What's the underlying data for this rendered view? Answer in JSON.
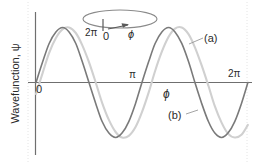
{
  "figure": {
    "axis_color": "#6f6f6f",
    "curve_a_color": "#d0d0d0",
    "curve_b_color": "#7a7a7a",
    "guide_color": "#e2e2e2"
  },
  "axes": {
    "y_title": "Wavefunction, ψ",
    "x_title": "ϕ",
    "x_ticks": [
      {
        "name": "origin",
        "label": "0"
      },
      {
        "name": "pi",
        "label": "π"
      },
      {
        "name": "two-pi",
        "label": "2π"
      }
    ]
  },
  "ring": {
    "label_start": "2π",
    "label_zero": "0",
    "label_angle": "ϕ"
  },
  "curves": [
    {
      "key": "a",
      "label": "(a)"
    },
    {
      "key": "b",
      "label": "(b)"
    }
  ],
  "chart_data": {
    "type": "line",
    "xlabel": "ϕ",
    "ylabel": "Wavefunction, ψ",
    "xlim": [
      0,
      6.283185307179586
    ],
    "ylim": [
      -1.15,
      1.15
    ],
    "xtick_values": [
      0,
      3.141592653589793,
      6.283185307179586
    ],
    "xtick_labels": [
      "0",
      "π",
      "2π"
    ],
    "grid": false,
    "legend": "inline-annotations",
    "annotations": [
      {
        "text": "(a)",
        "x": 5.5,
        "y": 0.85,
        "points_to": "curve-a"
      },
      {
        "text": "(b)",
        "x": 4.3,
        "y": -0.55,
        "points_to": "curve-b"
      },
      {
        "text": "ϕ",
        "x": 3.9,
        "y": -0.18,
        "points_to": "x-axis"
      },
      {
        "text": "2π",
        "x": 1.35,
        "y": 1.45,
        "points_to": "ring"
      },
      {
        "text": "0",
        "x": 1.78,
        "y": 1.4,
        "points_to": "ring"
      },
      {
        "text": "ϕ",
        "x": 2.45,
        "y": 1.42,
        "points_to": "ring-arrow"
      }
    ],
    "series": [
      {
        "name": "(a)",
        "key": "curve-a",
        "form": "sin(2ϕ) shifted",
        "color": "#d0d0d0",
        "amplitude": 1.0,
        "cycles": 2,
        "phase_deg": -12,
        "points": [
          {
            "x": 0.0,
            "y": -0.21
          },
          {
            "x": 0.2,
            "y": 0.18
          },
          {
            "x": 0.39,
            "y": 0.54
          },
          {
            "x": 0.59,
            "y": 0.81
          },
          {
            "x": 0.79,
            "y": 0.97
          },
          {
            "x": 0.98,
            "y": 1.0
          },
          {
            "x": 1.18,
            "y": 0.9
          },
          {
            "x": 1.37,
            "y": 0.68
          },
          {
            "x": 1.57,
            "y": 0.37
          },
          {
            "x": 1.77,
            "y": 0.0
          },
          {
            "x": 1.96,
            "y": -0.37
          },
          {
            "x": 2.16,
            "y": -0.68
          },
          {
            "x": 2.36,
            "y": -0.9
          },
          {
            "x": 2.55,
            "y": -1.0
          },
          {
            "x": 2.75,
            "y": -0.97
          },
          {
            "x": 2.95,
            "y": -0.81
          },
          {
            "x": 3.14,
            "y": -0.54
          },
          {
            "x": 3.34,
            "y": -0.18
          },
          {
            "x": 3.53,
            "y": 0.21
          },
          {
            "x": 3.73,
            "y": 0.56
          },
          {
            "x": 3.93,
            "y": 0.83
          },
          {
            "x": 4.12,
            "y": 0.98
          },
          {
            "x": 4.32,
            "y": 1.0
          },
          {
            "x": 4.52,
            "y": 0.88
          },
          {
            "x": 4.71,
            "y": 0.64
          },
          {
            "x": 4.91,
            "y": 0.31
          },
          {
            "x": 5.11,
            "y": -0.06
          },
          {
            "x": 5.3,
            "y": -0.43
          },
          {
            "x": 5.5,
            "y": -0.73
          },
          {
            "x": 5.69,
            "y": -0.93
          },
          {
            "x": 5.89,
            "y": -1.0
          },
          {
            "x": 6.09,
            "y": -0.95
          },
          {
            "x": 6.28,
            "y": -0.77
          }
        ]
      },
      {
        "name": "(b)",
        "key": "curve-b",
        "form": "sin(2ϕ)",
        "color": "#7a7a7a",
        "amplitude": 1.0,
        "cycles": 2,
        "phase_deg": 0,
        "points": [
          {
            "x": 0.0,
            "y": 0.0
          },
          {
            "x": 0.2,
            "y": 0.38
          },
          {
            "x": 0.39,
            "y": 0.71
          },
          {
            "x": 0.59,
            "y": 0.92
          },
          {
            "x": 0.79,
            "y": 1.0
          },
          {
            "x": 0.98,
            "y": 0.92
          },
          {
            "x": 1.18,
            "y": 0.71
          },
          {
            "x": 1.37,
            "y": 0.38
          },
          {
            "x": 1.57,
            "y": 0.0
          },
          {
            "x": 1.77,
            "y": -0.38
          },
          {
            "x": 1.96,
            "y": -0.71
          },
          {
            "x": 2.16,
            "y": -0.92
          },
          {
            "x": 2.36,
            "y": -1.0
          },
          {
            "x": 2.55,
            "y": -0.92
          },
          {
            "x": 2.75,
            "y": -0.71
          },
          {
            "x": 2.95,
            "y": -0.38
          },
          {
            "x": 3.14,
            "y": 0.0
          },
          {
            "x": 3.34,
            "y": 0.38
          },
          {
            "x": 3.53,
            "y": 0.71
          },
          {
            "x": 3.73,
            "y": 0.92
          },
          {
            "x": 3.93,
            "y": 1.0
          },
          {
            "x": 4.12,
            "y": 0.92
          },
          {
            "x": 4.32,
            "y": 0.71
          },
          {
            "x": 4.52,
            "y": 0.38
          },
          {
            "x": 4.71,
            "y": 0.0
          },
          {
            "x": 4.91,
            "y": -0.38
          },
          {
            "x": 5.11,
            "y": -0.71
          },
          {
            "x": 5.3,
            "y": -0.92
          },
          {
            "x": 5.5,
            "y": -1.0
          },
          {
            "x": 5.69,
            "y": -0.92
          },
          {
            "x": 5.89,
            "y": -0.71
          },
          {
            "x": 6.09,
            "y": -0.38
          },
          {
            "x": 6.28,
            "y": 0.0
          }
        ]
      }
    ]
  }
}
